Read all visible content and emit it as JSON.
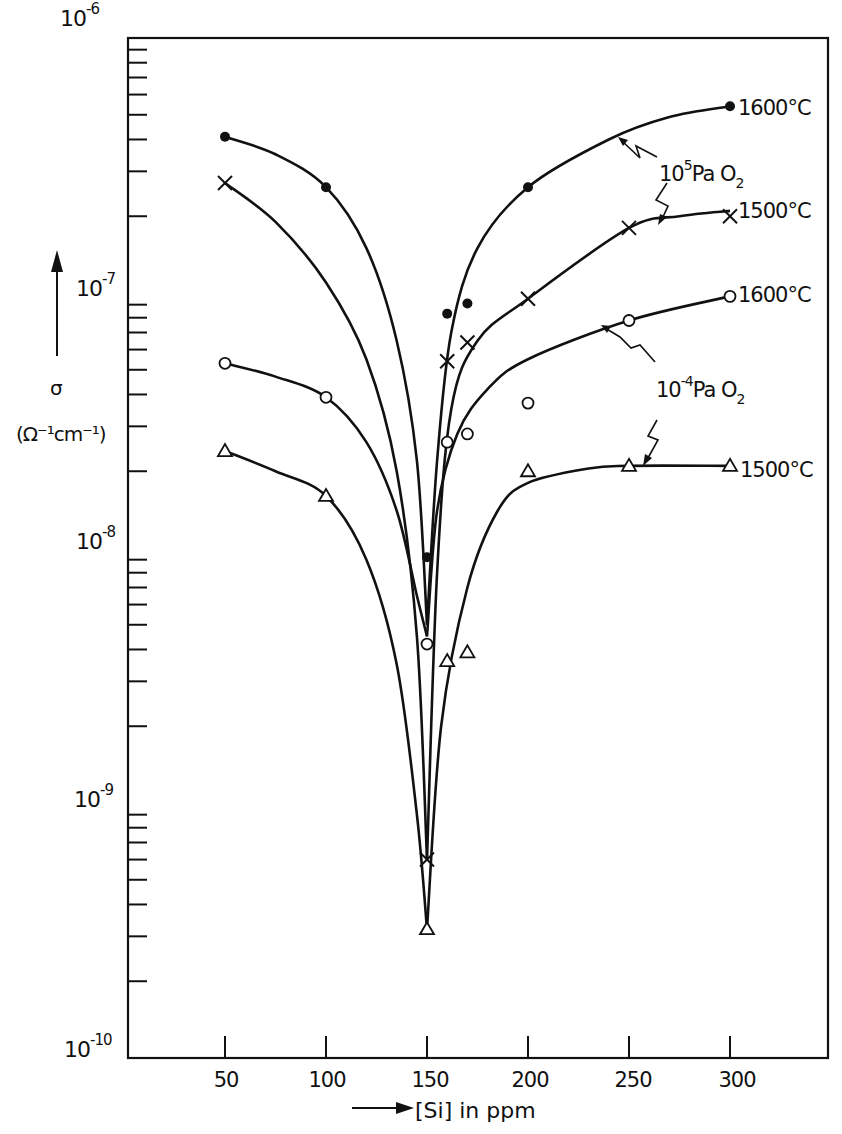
{
  "chart_data": {
    "type": "line",
    "title": "",
    "xlabel": "[Si] in ppm",
    "ylabel": "σ (Ω⁻¹cm⁻¹)",
    "ylabel_symbol": "σ",
    "ylabel_unit": "(Ω⁻¹cm⁻¹)",
    "yscale": "log",
    "ylim": [
      1e-10,
      1e-06
    ],
    "xlim": [
      0,
      350
    ],
    "x_ticks": [
      50,
      100,
      150,
      200,
      250,
      300
    ],
    "x_tick_labels": [
      "50",
      "100",
      "150",
      "200",
      "250",
      "300"
    ],
    "y_ticks": [
      {
        "base": "10",
        "exp": "-6"
      },
      {
        "base": "10",
        "exp": "-7"
      },
      {
        "base": "10",
        "exp": "-8"
      },
      {
        "base": "10",
        "exp": "-9"
      },
      {
        "base": "10",
        "exp": "-10"
      }
    ],
    "grid": false,
    "annotations": [
      {
        "text_base": "10",
        "text_exp": "5",
        "text_rest": "Pa O",
        "text_sub": "2",
        "refers_to": [
          "1600°C (10^5 Pa O2)",
          "1500°C (10^5 Pa O2)"
        ]
      },
      {
        "text_base": "10",
        "text_exp": "-4",
        "text_rest": "Pa O",
        "text_sub": "2",
        "refers_to": [
          "1600°C (10^-4 Pa O2)",
          "1500°C (10^-4 Pa O2)"
        ]
      }
    ],
    "series": [
      {
        "name": "1600°C, 10^5 Pa O2",
        "label": "1600°C",
        "marker": "filled-circle",
        "points": [
          [
            50,
            4.1e-07
          ],
          [
            100,
            2.6e-07
          ],
          [
            150,
            9.2e-09
          ],
          [
            160,
            8.3e-08
          ],
          [
            170,
            9.1e-08
          ],
          [
            200,
            2.6e-07
          ],
          [
            300,
            5.4e-07
          ]
        ],
        "curve_left": [
          [
            50,
            4.1e-07
          ],
          [
            75,
            3.5e-07
          ],
          [
            100,
            2.6e-07
          ],
          [
            120,
            1.5e-07
          ],
          [
            135,
            6.5e-08
          ],
          [
            145,
            2.2e-08
          ],
          [
            150,
            5e-09
          ]
        ],
        "curve_right": [
          [
            150,
            5e-09
          ],
          [
            155,
            2.2e-08
          ],
          [
            162,
            7e-08
          ],
          [
            175,
            1.5e-07
          ],
          [
            200,
            2.6e-07
          ],
          [
            240,
            4e-07
          ],
          [
            270,
            4.9e-07
          ],
          [
            300,
            5.4e-07
          ]
        ]
      },
      {
        "name": "1500°C, 10^5 Pa O2",
        "label": "1500°C",
        "marker": "cross",
        "points": [
          [
            50,
            2.7e-07
          ],
          [
            150,
            6e-10
          ],
          [
            160,
            5.4e-08
          ],
          [
            170,
            6.4e-08
          ],
          [
            200,
            9.5e-08
          ],
          [
            250,
            1.8e-07
          ],
          [
            300,
            2e-07
          ]
        ],
        "curve_left": [
          [
            50,
            2.7e-07
          ],
          [
            75,
            1.9e-07
          ],
          [
            100,
            1.1e-07
          ],
          [
            120,
            5.5e-08
          ],
          [
            135,
            2e-08
          ],
          [
            145,
            4.5e-09
          ],
          [
            150,
            6e-10
          ]
        ],
        "curve_right": [
          [
            150,
            6e-10
          ],
          [
            155,
            8e-09
          ],
          [
            162,
            3.5e-08
          ],
          [
            175,
            6.5e-08
          ],
          [
            200,
            9.5e-08
          ],
          [
            250,
            1.8e-07
          ],
          [
            275,
            2e-07
          ],
          [
            300,
            2.1e-07
          ]
        ]
      },
      {
        "name": "1600°C, 10^-4 Pa O2",
        "label": "1600°C",
        "marker": "open-circle",
        "points": [
          [
            50,
            5.3e-08
          ],
          [
            100,
            3.9e-08
          ],
          [
            150,
            4.2e-09
          ],
          [
            160,
            2.6e-08
          ],
          [
            170,
            2.8e-08
          ],
          [
            200,
            3.7e-08
          ],
          [
            250,
            7.8e-08
          ],
          [
            300,
            9.7e-08
          ]
        ],
        "curve_left": [
          [
            50,
            5.3e-08
          ],
          [
            75,
            4.7e-08
          ],
          [
            100,
            3.9e-08
          ],
          [
            120,
            2.6e-08
          ],
          [
            135,
            1.4e-08
          ],
          [
            145,
            6.5e-09
          ],
          [
            150,
            4.5e-09
          ]
        ],
        "curve_right": [
          [
            150,
            4.5e-09
          ],
          [
            155,
            1.4e-08
          ],
          [
            165,
            2.8e-08
          ],
          [
            180,
            4.2e-08
          ],
          [
            200,
            5.5e-08
          ],
          [
            250,
            7.8e-08
          ],
          [
            300,
            9.7e-08
          ]
        ]
      },
      {
        "name": "1500°C, 10^-4 Pa O2",
        "label": "1500°C",
        "marker": "open-triangle",
        "points": [
          [
            50,
            2.4e-08
          ],
          [
            100,
            1.6e-08
          ],
          [
            150,
            3.2e-10
          ],
          [
            160,
            3.6e-09
          ],
          [
            170,
            3.9e-09
          ],
          [
            200,
            2e-08
          ],
          [
            250,
            2.1e-08
          ],
          [
            300,
            2.1e-08
          ]
        ],
        "curve_left": [
          [
            50,
            2.4e-08
          ],
          [
            75,
            2e-08
          ],
          [
            100,
            1.6e-08
          ],
          [
            120,
            9e-09
          ],
          [
            135,
            3.5e-09
          ],
          [
            145,
            9e-10
          ],
          [
            150,
            3.2e-10
          ]
        ],
        "curve_right": [
          [
            150,
            3.2e-10
          ],
          [
            157,
            2e-09
          ],
          [
            170,
            7e-09
          ],
          [
            185,
            1.4e-08
          ],
          [
            200,
            1.8e-08
          ],
          [
            230,
            2.05e-08
          ],
          [
            250,
            2.1e-08
          ],
          [
            300,
            2.1e-08
          ]
        ]
      }
    ]
  }
}
